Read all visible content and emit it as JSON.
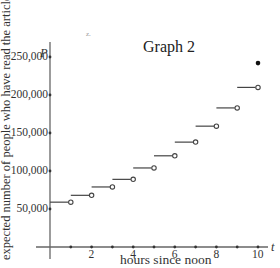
{
  "chart_data": {
    "type": "line",
    "subtype": "step-function",
    "title": "Graph 2",
    "xlabel": "hours since noon",
    "ylabel": "expected number of people who have read the article",
    "x_var": "t",
    "y_var": "P",
    "xlim": [
      0,
      10.5
    ],
    "ylim": [
      0,
      270000
    ],
    "x_ticks": [
      1,
      2,
      3,
      4,
      5,
      6,
      7,
      8,
      9,
      10
    ],
    "x_tick_labels": [
      "2",
      "4",
      "6",
      "8",
      "10"
    ],
    "x_tick_label_values": [
      2,
      4,
      6,
      8,
      10
    ],
    "y_ticks": [
      50000,
      100000,
      150000,
      200000,
      250000
    ],
    "y_tick_labels": [
      "50,000",
      "100,000",
      "150,000",
      "200,000",
      "250,000"
    ],
    "grid": false,
    "legend": null,
    "steps": [
      {
        "x_start": 0,
        "x_end": 1,
        "value": 59000,
        "left_closed": true,
        "right_open": true
      },
      {
        "x_start": 1,
        "x_end": 2,
        "value": 68000,
        "left_closed": true,
        "right_open": true
      },
      {
        "x_start": 2,
        "x_end": 3,
        "value": 79000,
        "left_closed": true,
        "right_open": true
      },
      {
        "x_start": 3,
        "x_end": 4,
        "value": 89000,
        "left_closed": true,
        "right_open": true
      },
      {
        "x_start": 4,
        "x_end": 5,
        "value": 104000,
        "left_closed": true,
        "right_open": true
      },
      {
        "x_start": 5,
        "x_end": 6,
        "value": 120000,
        "left_closed": true,
        "right_open": true
      },
      {
        "x_start": 6,
        "x_end": 7,
        "value": 138000,
        "left_closed": true,
        "right_open": true
      },
      {
        "x_start": 7,
        "x_end": 8,
        "value": 159000,
        "left_closed": true,
        "right_open": true
      },
      {
        "x_start": 8,
        "x_end": 9,
        "value": 183000,
        "left_closed": true,
        "right_open": true
      },
      {
        "x_start": 9,
        "x_end": 10,
        "value": 210000,
        "left_closed": true,
        "right_open": true
      }
    ],
    "closed_points": [
      {
        "x": 10,
        "y": 242000
      }
    ]
  },
  "annotations": {
    "speck": "z."
  }
}
